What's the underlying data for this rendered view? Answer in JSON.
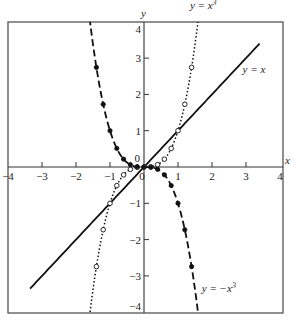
{
  "chart_data": {
    "type": "line",
    "title": "",
    "xlabel": "x",
    "ylabel": "y",
    "xlim": [
      -4,
      4
    ],
    "ylim": [
      -4,
      4
    ],
    "grid": false,
    "x_ticks": [
      -4,
      -3,
      -2,
      -1,
      0,
      1,
      2,
      3,
      4
    ],
    "y_ticks": [
      -4,
      -3,
      -2,
      -1,
      0,
      1,
      2,
      3,
      4
    ],
    "x_tick_labels": [
      "−4",
      "−3",
      "−2",
      "−1",
      "0",
      "1",
      "2",
      "3",
      "4"
    ],
    "y_tick_labels": [
      "−4",
      "−3",
      "−2",
      "−1",
      "0",
      "1",
      "2",
      "3",
      "4"
    ],
    "series": [
      {
        "name": "y = x",
        "style": "solid",
        "function": "x",
        "x_range": [
          -3.35,
          3.4
        ],
        "label": "y = x",
        "label_pos": [
          2.9,
          2.6
        ],
        "markers": "none"
      },
      {
        "name": "y = x^3",
        "style": "dotted",
        "function": "x^3",
        "x_range": [
          -1.6,
          1.6
        ],
        "label": "y = x",
        "label_sup": "3",
        "label_pos": [
          1.35,
          4.35
        ],
        "markers": "open-circle",
        "x": [
          -1.4,
          -1.2,
          -1.0,
          -0.8,
          -0.6,
          -0.4,
          -0.2,
          0,
          0.2,
          0.4,
          0.6,
          0.8,
          1.0,
          1.2,
          1.4
        ],
        "values": [
          -2.744,
          -1.728,
          -1.0,
          -0.512,
          -0.216,
          -0.064,
          -0.008,
          0,
          0.008,
          0.064,
          0.216,
          0.512,
          1.0,
          1.728,
          2.744
        ]
      },
      {
        "name": "y = -x^3",
        "style": "dashed",
        "function": "-x^3",
        "x_range": [
          -1.6,
          1.6
        ],
        "label": "y = −x",
        "label_sup": "3",
        "label_pos": [
          1.7,
          -3.45
        ],
        "markers": "filled-circle",
        "x": [
          -1.4,
          -1.2,
          -1.0,
          -0.8,
          -0.6,
          -0.4,
          -0.2,
          0,
          0.2,
          0.4,
          0.6,
          0.8,
          1.0,
          1.2,
          1.4
        ],
        "values": [
          2.744,
          1.728,
          1.0,
          0.512,
          0.216,
          0.064,
          0.008,
          0,
          -0.008,
          -0.064,
          -0.216,
          -0.512,
          -1.0,
          -1.728,
          -2.744
        ]
      }
    ],
    "legend": "none (inline curve labels)"
  },
  "axes": {
    "x_label": "x",
    "y_label": "y"
  },
  "colors": {
    "line": "#111111",
    "frame": "#555555",
    "background": "#ffffff"
  }
}
